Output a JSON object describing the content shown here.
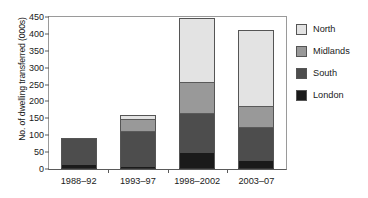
{
  "chart_data": {
    "type": "bar",
    "subtype": "stacked-vertical",
    "title": "",
    "xlabel": "",
    "ylabel": "No. of dwelling transferred (000s)",
    "categories": [
      "1988–92",
      "1993–97",
      "1998–2002",
      "2003–07"
    ],
    "series": [
      {
        "name": "London",
        "color": "#1a1a1a",
        "values": [
          12,
          5,
          47,
          23
        ]
      },
      {
        "name": "South",
        "color": "#4d4d4d",
        "values": [
          81,
          108,
          119,
          101
        ]
      },
      {
        "name": "Midlands",
        "color": "#999999",
        "values": [
          0,
          35,
          92,
          63
        ]
      },
      {
        "name": "North",
        "color": "#e3e3e3",
        "values": [
          0,
          13,
          190,
          224
        ]
      }
    ],
    "totals": [
      93,
      161,
      448,
      411
    ],
    "ylim": [
      0,
      450
    ],
    "ytick_step": 50,
    "yticks": [
      0,
      50,
      100,
      150,
      200,
      250,
      300,
      350,
      400,
      450
    ],
    "grid": false,
    "legend_position": "right",
    "legend_order": [
      "North",
      "Midlands",
      "South",
      "London"
    ]
  },
  "legend": {
    "items": [
      {
        "label": "North",
        "color": "#e3e3e3"
      },
      {
        "label": "Midlands",
        "color": "#999999"
      },
      {
        "label": "South",
        "color": "#4d4d4d"
      },
      {
        "label": "London",
        "color": "#1a1a1a"
      }
    ]
  }
}
